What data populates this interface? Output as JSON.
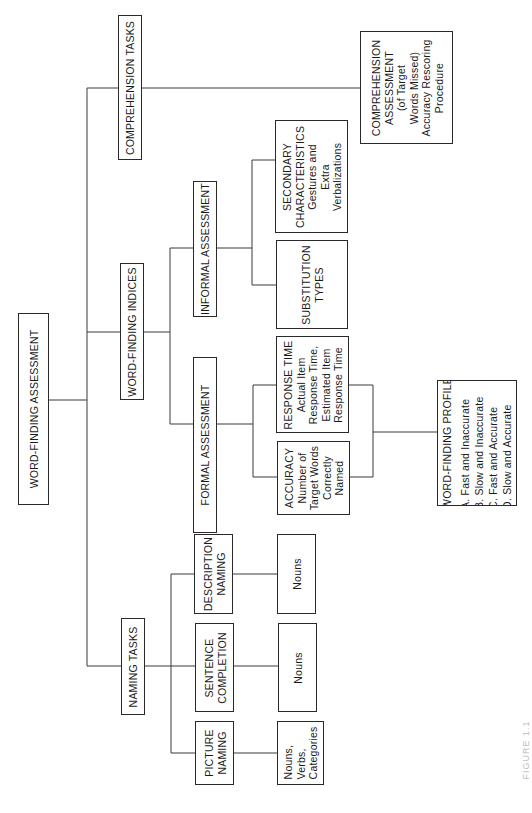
{
  "diagram": {
    "type": "hierarchy",
    "orientation": "rotated-90-ccw",
    "root": {
      "id": "word_finding_assessment",
      "label": "WORD-FINDING ASSESSMENT"
    },
    "level1": [
      {
        "id": "comprehension_tasks",
        "label": "COMPREHENSION TASKS"
      },
      {
        "id": "word_finding_indices",
        "label": "WORD-FINDING INDICES"
      },
      {
        "id": "naming_tasks",
        "label": "NAMING TASKS"
      }
    ],
    "comprehension_assessment": {
      "lines": [
        "COMPREHENSION",
        "ASSESSMENT",
        "(of Target",
        "Words Missed)",
        "Accuracy Rescoring",
        "Procedure"
      ]
    },
    "indices": {
      "informal": {
        "label": "INFORMAL ASSESSMENT"
      },
      "formal": {
        "label": "FORMAL ASSESSMENT"
      },
      "secondary_characteristics": {
        "lines": [
          "SECONDARY",
          "CHARACTERISTICS",
          "Gestures and",
          "Extra",
          "Verbalizations"
        ]
      },
      "substitution_types": {
        "lines": [
          "SUBSTITUTION",
          "TYPES"
        ]
      },
      "response_time": {
        "lines": [
          "RESPONSE TIME",
          "Actual Item",
          "Response Time,",
          "Estimated Item",
          "Response Time"
        ]
      },
      "accuracy": {
        "lines": [
          "ACCURACY",
          "Number of",
          "Target Words",
          "Correctly",
          "Named"
        ]
      },
      "profile": {
        "title": "WORD-FINDING PROFILE",
        "items": [
          "A. Fast and Inaccurate",
          "B. Slow and Inaccurate",
          "C. Fast and Accurate",
          "D. Slow and Accurate"
        ]
      }
    },
    "naming": {
      "description_naming": {
        "lines": [
          "DESCRIPTION",
          "NAMING"
        ],
        "target": "Nouns"
      },
      "sentence_completion": {
        "lines": [
          "SENTENCE",
          "COMPLETION"
        ],
        "target": "Nouns"
      },
      "picture_naming": {
        "lines": [
          "PICTURE",
          "NAMING"
        ],
        "target_lines": [
          "Nouns,",
          "Verbs,",
          "Categories"
        ]
      }
    },
    "caption": "FIGURE 1.1"
  }
}
